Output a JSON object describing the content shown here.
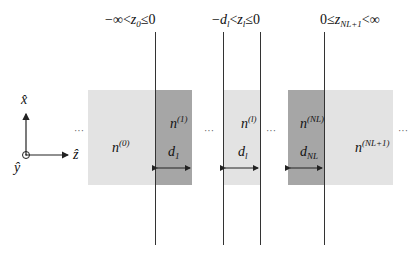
{
  "regions": [
    {
      "id": "n0",
      "index": "(0)",
      "color": "#e3e3e3"
    },
    {
      "id": "n1",
      "index": "(1)",
      "thickness": "d",
      "thickness_sub": "1",
      "color": "#a6a6a6"
    },
    {
      "id": "nl",
      "index": "(l)",
      "thickness": "d",
      "thickness_sub": "l",
      "color": "#e3e3e3"
    },
    {
      "id": "nNL",
      "index": "(NL)",
      "thickness": "d",
      "thickness_sub": "NL",
      "color": "#a6a6a6"
    },
    {
      "id": "nNL1",
      "index": "(NL+1)",
      "color": "#e3e3e3"
    }
  ],
  "n_symbol": "n",
  "ellipsis": "···",
  "top_labels": {
    "z0": {
      "left": "−∞<",
      "var": "z",
      "sub": "0",
      "right": "≤0"
    },
    "zl": {
      "left": "−",
      "dvar": "d",
      "dsub": "l",
      "mid": "<",
      "var": "z",
      "sub": "l",
      "right": "≤0"
    },
    "zN": {
      "left": "0≤",
      "var": "z",
      "sub": "NL+1",
      "right": "<∞"
    }
  },
  "axes": {
    "x": "x̂",
    "y": "ŷ",
    "z": "ẑ"
  }
}
